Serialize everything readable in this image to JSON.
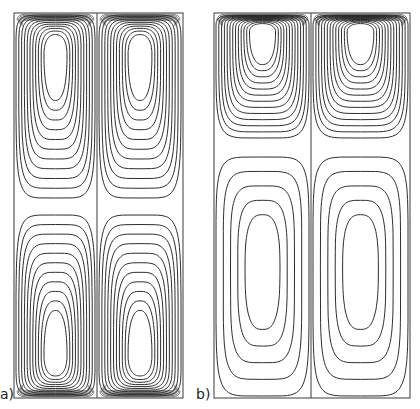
{
  "figure": {
    "panels": [
      {
        "id": "a",
        "label": "a)",
        "frame": {
          "x": 14,
          "y": 13,
          "w": 169,
          "h": 385
        },
        "divider_x": 97,
        "cells": [
          {
            "column": "left",
            "region": "top",
            "eddy_center_y": 55,
            "extent_y": [
              13,
              200
            ],
            "contours": 11,
            "dense_wall": "top"
          },
          {
            "column": "right",
            "region": "top",
            "eddy_center_y": 55,
            "extent_y": [
              13,
              200
            ],
            "contours": 11,
            "dense_wall": "top"
          },
          {
            "column": "left",
            "region": "bottom",
            "eddy_center_y": 355,
            "extent_y": [
              213,
              398
            ],
            "contours": 11,
            "dense_wall": "bottom"
          },
          {
            "column": "right",
            "region": "bottom",
            "eddy_center_y": 355,
            "extent_y": [
              213,
              398
            ],
            "contours": 11,
            "dense_wall": "bottom"
          }
        ]
      },
      {
        "id": "b",
        "label": "b)",
        "frame": {
          "x": 214,
          "y": 13,
          "w": 196,
          "h": 385
        },
        "divider_x": 311,
        "cells": [
          {
            "column": "left",
            "region": "top",
            "eddy_center_y": 32,
            "extent_y": [
              13,
              140
            ],
            "contours": 13,
            "dense_wall": "top"
          },
          {
            "column": "right",
            "region": "top",
            "eddy_center_y": 32,
            "extent_y": [
              13,
              140
            ],
            "contours": 13,
            "dense_wall": "top"
          },
          {
            "column": "left",
            "region": "bottom",
            "eddy_center_y": 268,
            "extent_y": [
              155,
              398
            ],
            "contours": 5,
            "dense_wall": "none"
          },
          {
            "column": "right",
            "region": "bottom",
            "eddy_center_y": 268,
            "extent_y": [
              155,
              398
            ],
            "contours": 5,
            "dense_wall": "none"
          }
        ]
      }
    ],
    "colors": {
      "line": "#2e2e2e",
      "background": "#ffffff"
    }
  }
}
